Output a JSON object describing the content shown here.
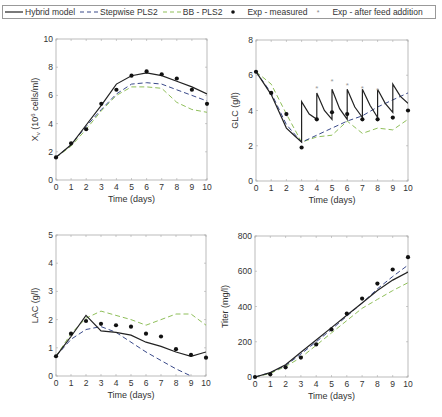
{
  "legend": {
    "items": [
      {
        "label": "Hybrid model",
        "style": "solid",
        "color": "#222222"
      },
      {
        "label": "Stepwise  PLS2",
        "style": "dashed",
        "color": "#3a4a8a"
      },
      {
        "label": "BB - PLS2",
        "style": "dashed",
        "color": "#8fbf5a"
      },
      {
        "label": "Exp - measured",
        "style": "dot",
        "color": "#111111"
      },
      {
        "label": "Exp - after feed addition",
        "style": "star",
        "color": "#888888"
      }
    ]
  },
  "colors": {
    "hybrid": "#222222",
    "stepwise": "#3a4a8a",
    "bb": "#8fbf5a",
    "exp": "#111111",
    "feed": "#999999",
    "axis": "#aaaaaa"
  },
  "chart_data": [
    {
      "type": "line",
      "ylabel": "X_v (10^6 cells/ml)",
      "xlabel": "Time (days)",
      "xlim": [
        0,
        10
      ],
      "ylim": [
        0,
        10
      ],
      "yticks": [
        0,
        2,
        4,
        6,
        8,
        10
      ],
      "xticks": [
        0,
        1,
        2,
        3,
        4,
        5,
        6,
        7,
        8,
        9,
        10
      ],
      "box": {
        "x0": 56,
        "x1": 207,
        "y0": 180,
        "y1": 39
      },
      "series": [
        {
          "name": "Hybrid model",
          "x": [
            0,
            1,
            2,
            3,
            4,
            5,
            6,
            7,
            8,
            9,
            10
          ],
          "y": [
            1.6,
            2.5,
            3.9,
            5.3,
            6.8,
            7.4,
            7.6,
            7.4,
            7.0,
            6.6,
            6.1
          ]
        },
        {
          "name": "Stepwise PLS2",
          "x": [
            0,
            1,
            2,
            3,
            4,
            5,
            6,
            7,
            8,
            9,
            10
          ],
          "y": [
            1.6,
            2.5,
            3.8,
            5.0,
            6.1,
            6.8,
            6.9,
            6.8,
            6.4,
            6.0,
            5.6
          ]
        },
        {
          "name": "BB - PLS2",
          "x": [
            0,
            1,
            2,
            3,
            4,
            5,
            6,
            7,
            8,
            9,
            10
          ],
          "y": [
            1.6,
            2.4,
            3.6,
            4.9,
            6.0,
            6.6,
            6.6,
            6.5,
            5.5,
            5.0,
            4.8
          ]
        }
      ],
      "measured": {
        "x": [
          0,
          1,
          2,
          3,
          4,
          5,
          6,
          7,
          8,
          9,
          10
        ],
        "y": [
          1.6,
          2.6,
          3.6,
          5.4,
          6.4,
          7.4,
          7.7,
          7.5,
          7.2,
          6.4,
          5.4
        ]
      }
    },
    {
      "type": "line",
      "ylabel": "GLC (g/l)",
      "xlabel": "Time (days)",
      "xlim": [
        0,
        10
      ],
      "ylim": [
        0,
        8
      ],
      "yticks": [
        0,
        2,
        4,
        6,
        8
      ],
      "xticks": [
        0,
        1,
        2,
        3,
        4,
        5,
        6,
        7,
        8,
        9,
        10
      ],
      "box": {
        "x0": 256,
        "x1": 408,
        "y0": 181,
        "y1": 40
      },
      "series": [
        {
          "name": "Hybrid model",
          "x": [
            0,
            1,
            2,
            2.5,
            3,
            3,
            3.5,
            4,
            4,
            4.5,
            5,
            5,
            5.5,
            6,
            6,
            6.5,
            7,
            7,
            7.5,
            8,
            8,
            8.5,
            9,
            9,
            9.5,
            10
          ],
          "y": [
            6.2,
            4.9,
            3.0,
            2.6,
            2.2,
            4.5,
            3.8,
            3.5,
            5.0,
            4.0,
            3.5,
            5.2,
            4.1,
            3.5,
            5.2,
            4.2,
            3.6,
            5.2,
            4.3,
            3.6,
            5.2,
            4.4,
            3.9,
            5.5,
            4.8,
            4.4
          ]
        },
        {
          "name": "Stepwise PLS2",
          "x": [
            0,
            1,
            2,
            3,
            4,
            5,
            6,
            7,
            8,
            9,
            10
          ],
          "y": [
            6.2,
            5.0,
            3.2,
            2.2,
            2.6,
            3.0,
            3.4,
            3.7,
            4.2,
            4.6,
            5.0
          ]
        },
        {
          "name": "BB - PLS2",
          "x": [
            0,
            1,
            2,
            3,
            4,
            5,
            6,
            7,
            8,
            9,
            10
          ],
          "y": [
            6.2,
            5.5,
            3.8,
            2.2,
            2.5,
            2.6,
            3.4,
            2.7,
            3.0,
            2.9,
            3.5
          ]
        }
      ],
      "measured": {
        "x": [
          0,
          1,
          2,
          3,
          4,
          5,
          6,
          7,
          8,
          9,
          10
        ],
        "y": [
          6.2,
          5.0,
          3.8,
          1.9,
          3.5,
          3.9,
          3.8,
          3.5,
          3.5,
          3.6,
          4.0
        ]
      },
      "after_feed": {
        "x": [
          4,
          5,
          6,
          7,
          8
        ],
        "y": [
          5.3,
          5.7,
          5.5,
          5.3,
          5.2
        ]
      }
    },
    {
      "type": "line",
      "ylabel": "LAC (g/l)",
      "xlabel": "Time (days)",
      "xlim": [
        0,
        10
      ],
      "ylim": [
        0,
        5
      ],
      "yticks": [
        0,
        1,
        2,
        3,
        4,
        5
      ],
      "xticks": [
        0,
        1,
        2,
        3,
        4,
        5,
        6,
        7,
        8,
        9,
        10
      ],
      "box": {
        "x0": 56,
        "x1": 206,
        "y0": 376,
        "y1": 235
      },
      "series": [
        {
          "name": "Hybrid model",
          "x": [
            0,
            1,
            2,
            3,
            4,
            5,
            6,
            7,
            8,
            9,
            10
          ],
          "y": [
            0.7,
            1.4,
            2.15,
            1.6,
            1.55,
            1.45,
            1.2,
            1.05,
            0.85,
            0.7,
            0.85
          ]
        },
        {
          "name": "Stepwise PLS2",
          "x": [
            0,
            1,
            2,
            3,
            4,
            5,
            6,
            7,
            8,
            9,
            10
          ],
          "y": [
            0.7,
            1.3,
            1.65,
            1.75,
            1.55,
            1.2,
            0.85,
            0.55,
            0.25,
            0.0,
            -0.2
          ]
        },
        {
          "name": "BB - PLS2",
          "x": [
            0,
            1,
            2,
            3,
            4,
            5,
            6,
            7,
            8,
            9,
            10
          ],
          "y": [
            0.7,
            1.5,
            2.05,
            2.3,
            2.15,
            2.0,
            1.8,
            2.0,
            2.2,
            2.2,
            1.8
          ]
        }
      ],
      "measured": {
        "x": [
          0,
          1,
          2,
          3,
          4,
          5,
          6,
          7,
          8,
          9,
          10
        ],
        "y": [
          0.7,
          1.5,
          1.95,
          1.85,
          1.8,
          1.75,
          1.5,
          1.4,
          0.95,
          0.75,
          0.65
        ]
      }
    },
    {
      "type": "line",
      "ylabel": "Titer (mg/l)",
      "xlabel": "Time (days)",
      "xlim": [
        0,
        10
      ],
      "ylim": [
        0,
        800
      ],
      "yticks": [
        0,
        200,
        400,
        600,
        800
      ],
      "xticks": [
        0,
        1,
        2,
        3,
        4,
        5,
        6,
        7,
        8,
        9,
        10
      ],
      "box": {
        "x0": 255,
        "x1": 408,
        "y0": 377,
        "y1": 236
      },
      "series": [
        {
          "name": "Hybrid model",
          "x": [
            0,
            1,
            2,
            3,
            4,
            5,
            6,
            7,
            8,
            9,
            10
          ],
          "y": [
            0,
            25,
            70,
            140,
            210,
            280,
            350,
            420,
            490,
            550,
            595
          ]
        },
        {
          "name": "Stepwise PLS2",
          "x": [
            0,
            1,
            2,
            3,
            4,
            5,
            6,
            7,
            8,
            9,
            10
          ],
          "y": [
            0,
            25,
            65,
            130,
            200,
            270,
            345,
            420,
            500,
            570,
            635
          ]
        },
        {
          "name": "BB - PLS2",
          "x": [
            0,
            1,
            2,
            3,
            4,
            5,
            6,
            7,
            8,
            9,
            10
          ],
          "y": [
            0,
            20,
            60,
            110,
            180,
            250,
            320,
            390,
            440,
            490,
            535
          ]
        }
      ],
      "measured": {
        "x": [
          0,
          1,
          2,
          3,
          4,
          5,
          6,
          7,
          8,
          9,
          10
        ],
        "y": [
          0,
          15,
          55,
          110,
          185,
          270,
          360,
          445,
          530,
          610,
          680
        ]
      }
    }
  ]
}
